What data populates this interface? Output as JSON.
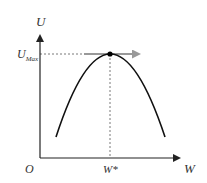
{
  "diagram": {
    "y_axis_label": "U",
    "x_axis_label": "W",
    "origin_label": "O",
    "max_label_main": "U",
    "max_label_sub": "Max",
    "optimum_label": "W*",
    "curve": "inverted-parabola",
    "colors": {
      "axis": "#222222",
      "curve": "#111111",
      "dashed": "#555555",
      "tangent_arrow": "#999999",
      "peak_point": "#000000"
    }
  }
}
